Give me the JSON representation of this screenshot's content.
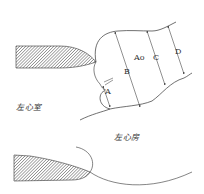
{
  "diagram": {
    "type": "anatomical-line-drawing",
    "colors": {
      "line": "#333333",
      "hatch": "#444444",
      "background": "#ffffff"
    },
    "labels": {
      "left_ventricle": "左心室",
      "left_atrium": "左心房",
      "aorta": "Ao",
      "measure_a": "A",
      "measure_b": "B",
      "measure_c": "C",
      "measure_d": "D"
    },
    "measurements": [
      {
        "id": "A",
        "description": "annulus level"
      },
      {
        "id": "B",
        "description": "sinus level"
      },
      {
        "id": "C",
        "description": "sinotubular junction level"
      },
      {
        "id": "D",
        "description": "ascending aorta level"
      }
    ]
  }
}
